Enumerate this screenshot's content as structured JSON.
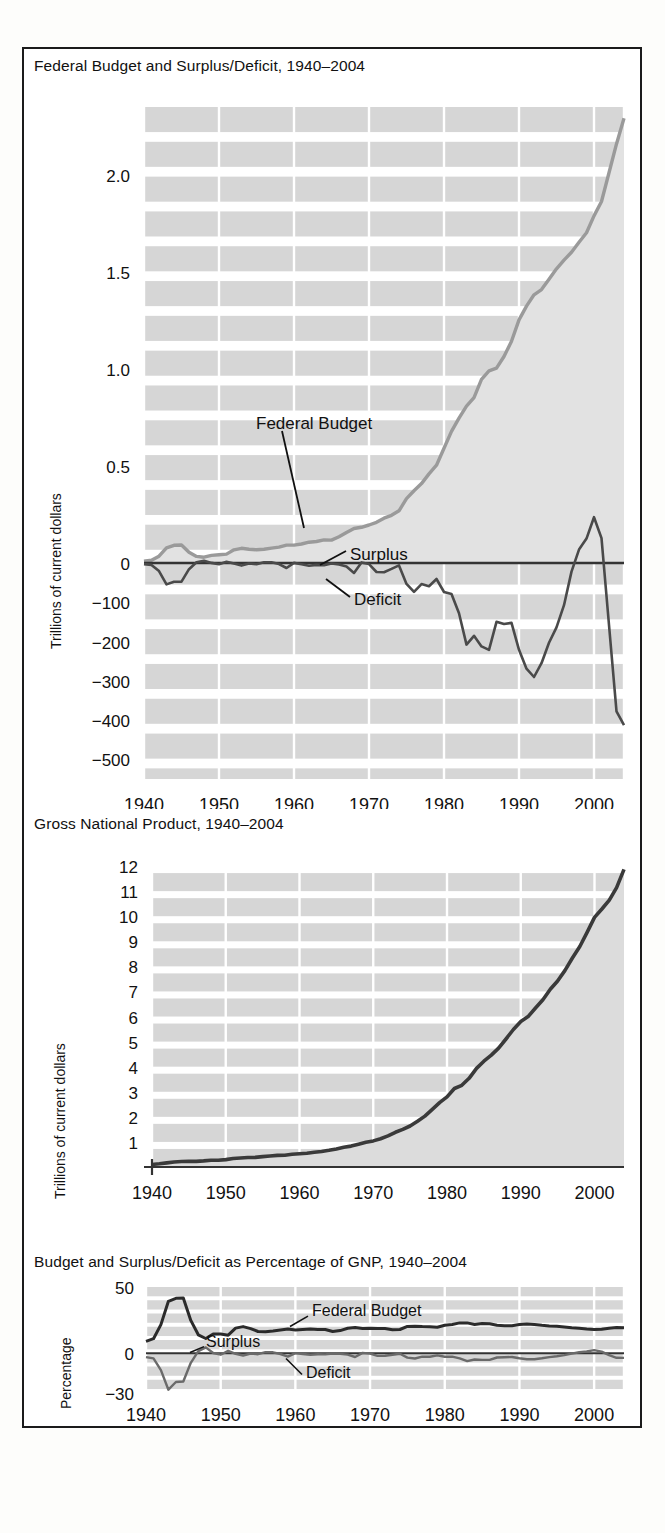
{
  "figure": {
    "background": "#ffffff",
    "border_color": "#1b1b1b",
    "grid_band_color": "#cfcfcf",
    "grid_line_color": "#ffffff",
    "axis_color": "#333333",
    "budget_line_color": "#9a9a9a",
    "budget_fill_color": "#e2e2e2",
    "deficit_line_color": "#4a4a4a",
    "gnp_line_color": "#3a3a3a",
    "gnp_fill_color": "#dcdcdc"
  },
  "chart_data": [
    {
      "id": "federal-budget-surplus-deficit",
      "type": "line",
      "title": "Federal Budget and Surplus/Deficit, 1940–2004",
      "xlabel": "",
      "ylabel": "Trillions of current dollars",
      "grid": true,
      "legend_position": "inline-annotation",
      "annotations": [
        {
          "label": "Federal Budget",
          "x": 1960,
          "y": 0.63
        },
        {
          "label": "Surplus",
          "x": 1967,
          "y": 0.1
        },
        {
          "label": "Deficit",
          "x": 1967,
          "y": -0.1
        }
      ],
      "xlim": [
        1940,
        2004
      ],
      "xticks": [
        1940,
        1950,
        1960,
        1970,
        1980,
        1990,
        2000
      ],
      "yticks_upper": [
        0,
        0.5,
        1.0,
        1.5,
        2.0
      ],
      "yticklabels_upper": [
        "0",
        "0.5",
        "1.0",
        "1.5",
        "2.0"
      ],
      "yticks_lower": [
        -100,
        -200,
        -300,
        -400,
        -500
      ],
      "yticklabels_lower": [
        "−100",
        "−200",
        "−300",
        "−400",
        "−500"
      ],
      "ylim_upper": [
        0,
        2.35
      ],
      "ylim_lower": [
        -550,
        0
      ],
      "note_upper_units": "Trillions of current dollars",
      "note_lower_units": "Billions of current dollars",
      "series": [
        {
          "name": "Federal Budget",
          "x": [
            1940,
            1941,
            1942,
            1943,
            1944,
            1945,
            1946,
            1947,
            1948,
            1949,
            1950,
            1951,
            1952,
            1953,
            1954,
            1955,
            1956,
            1957,
            1958,
            1959,
            1960,
            1961,
            1962,
            1963,
            1964,
            1965,
            1966,
            1967,
            1968,
            1969,
            1970,
            1971,
            1972,
            1973,
            1974,
            1975,
            1976,
            1977,
            1978,
            1979,
            1980,
            1981,
            1982,
            1983,
            1984,
            1985,
            1986,
            1987,
            1988,
            1989,
            1990,
            1991,
            1992,
            1993,
            1994,
            1995,
            1996,
            1997,
            1998,
            1999,
            2000,
            2001,
            2002,
            2003,
            2004
          ],
          "values": [
            0.009,
            0.014,
            0.035,
            0.078,
            0.091,
            0.093,
            0.055,
            0.034,
            0.03,
            0.039,
            0.043,
            0.046,
            0.068,
            0.076,
            0.071,
            0.068,
            0.071,
            0.077,
            0.082,
            0.092,
            0.092,
            0.098,
            0.107,
            0.111,
            0.119,
            0.118,
            0.135,
            0.157,
            0.178,
            0.184,
            0.196,
            0.21,
            0.231,
            0.246,
            0.269,
            0.332,
            0.372,
            0.409,
            0.459,
            0.504,
            0.591,
            0.678,
            0.746,
            0.808,
            0.852,
            0.946,
            0.99,
            1.004,
            1.064,
            1.143,
            1.253,
            1.324,
            1.382,
            1.409,
            1.462,
            1.516,
            1.561,
            1.601,
            1.653,
            1.702,
            1.789,
            1.863,
            2.011,
            2.16,
            2.292
          ]
        },
        {
          "name": "Surplus/Deficit",
          "x": [
            1940,
            1941,
            1942,
            1943,
            1944,
            1945,
            1946,
            1947,
            1948,
            1949,
            1950,
            1951,
            1952,
            1953,
            1954,
            1955,
            1956,
            1957,
            1958,
            1959,
            1960,
            1961,
            1962,
            1963,
            1964,
            1965,
            1966,
            1967,
            1968,
            1969,
            1970,
            1971,
            1972,
            1973,
            1974,
            1975,
            1976,
            1977,
            1978,
            1979,
            1980,
            1981,
            1982,
            1983,
            1984,
            1985,
            1986,
            1987,
            1988,
            1989,
            1990,
            1991,
            1992,
            1993,
            1994,
            1995,
            1996,
            1997,
            1998,
            1999,
            2000,
            2001,
            2002,
            2003,
            2004
          ],
          "values": [
            -2.9,
            -4.9,
            -20.5,
            -54.6,
            -47.6,
            -47.6,
            -15.9,
            4.0,
            11.8,
            0.6,
            -3.1,
            6.1,
            -1.5,
            -6.5,
            -1.2,
            -3.0,
            3.9,
            3.4,
            -2.8,
            -12.8,
            0.3,
            -3.3,
            -7.1,
            -4.8,
            -5.9,
            -1.4,
            -3.7,
            -8.6,
            -25.2,
            3.2,
            -2.8,
            -23.0,
            -23.4,
            -14.9,
            -6.1,
            -53.2,
            -73.7,
            -53.7,
            -59.2,
            -40.7,
            -73.8,
            -79.0,
            -128.0,
            -207.8,
            -185.4,
            -212.3,
            -221.2,
            -149.7,
            -155.2,
            -152.6,
            -221.0,
            -269.2,
            -290.3,
            -255.1,
            -203.2,
            -164.0,
            -107.4,
            -21.9,
            69.3,
            125.6,
            236.2,
            128.2,
            -157.8,
            -377.6,
            -412.7
          ]
        }
      ]
    },
    {
      "id": "gross-national-product",
      "type": "area",
      "title": "Gross National Product, 1940–2004",
      "xlabel": "",
      "ylabel": "Trillions of current dollars",
      "grid": true,
      "legend_position": "none",
      "xlim": [
        1940,
        2004
      ],
      "xticks": [
        1940,
        1950,
        1960,
        1970,
        1980,
        1990,
        2000
      ],
      "yticks": [
        1,
        2,
        3,
        4,
        5,
        6,
        7,
        8,
        9,
        10,
        11,
        12
      ],
      "yticklabels": [
        "1",
        "2",
        "3",
        "4",
        "5",
        "6",
        "7",
        "8",
        "9",
        "10",
        "11",
        "12"
      ],
      "ylim": [
        0,
        12.6
      ],
      "series": [
        {
          "name": "GNP",
          "x": [
            1940,
            1941,
            1942,
            1943,
            1944,
            1945,
            1946,
            1947,
            1948,
            1949,
            1950,
            1951,
            1952,
            1953,
            1954,
            1955,
            1956,
            1957,
            1958,
            1959,
            1960,
            1961,
            1962,
            1963,
            1964,
            1965,
            1966,
            1967,
            1968,
            1969,
            1970,
            1971,
            1972,
            1973,
            1974,
            1975,
            1976,
            1977,
            1978,
            1979,
            1980,
            1981,
            1982,
            1983,
            1984,
            1985,
            1986,
            1987,
            1988,
            1989,
            1990,
            1991,
            1992,
            1993,
            1994,
            1995,
            1996,
            1997,
            1998,
            1999,
            2000,
            2001,
            2002,
            2003,
            2004
          ],
          "values": [
            0.101,
            0.127,
            0.162,
            0.199,
            0.219,
            0.223,
            0.222,
            0.244,
            0.27,
            0.268,
            0.294,
            0.339,
            0.358,
            0.379,
            0.381,
            0.415,
            0.438,
            0.461,
            0.468,
            0.505,
            0.527,
            0.545,
            0.586,
            0.618,
            0.664,
            0.72,
            0.789,
            0.834,
            0.911,
            0.985,
            1.039,
            1.128,
            1.24,
            1.385,
            1.501,
            1.635,
            1.824,
            2.031,
            2.295,
            2.566,
            2.795,
            3.131,
            3.259,
            3.535,
            3.933,
            4.22,
            4.463,
            4.739,
            5.104,
            5.484,
            5.803,
            5.996,
            6.338,
            6.667,
            7.085,
            7.415,
            7.839,
            8.332,
            8.794,
            9.354,
            9.952,
            10.286,
            10.642,
            11.142,
            11.868
          ]
        }
      ]
    },
    {
      "id": "budget-deficit-pct-gnp",
      "type": "line",
      "title": "Budget and Surplus/Deficit as Percentage of GNP, 1940–2004",
      "xlabel": "",
      "ylabel": "Percentage",
      "grid": true,
      "legend_position": "inline-annotation",
      "annotations": [
        {
          "label": "Federal Budget",
          "x": 1977,
          "y": 28
        },
        {
          "label": "Surplus",
          "x": 1955,
          "y": 7
        },
        {
          "label": "Deficit",
          "x": 1968,
          "y": -14
        }
      ],
      "xlim": [
        1940,
        2004
      ],
      "xticks": [
        1940,
        1950,
        1960,
        1970,
        1980,
        1990,
        2000
      ],
      "yticks": [
        -30,
        0,
        50
      ],
      "yticklabels": [
        "−30",
        "0",
        "50"
      ],
      "ylim": [
        -30,
        50
      ],
      "series": [
        {
          "name": "Federal Budget",
          "x": [
            1940,
            1941,
            1942,
            1943,
            1944,
            1945,
            1946,
            1947,
            1948,
            1949,
            1950,
            1951,
            1952,
            1953,
            1954,
            1955,
            1956,
            1957,
            1958,
            1959,
            1960,
            1961,
            1962,
            1963,
            1964,
            1965,
            1966,
            1967,
            1968,
            1969,
            1970,
            1971,
            1972,
            1973,
            1974,
            1975,
            1976,
            1977,
            1978,
            1979,
            1980,
            1981,
            1982,
            1983,
            1984,
            1985,
            1986,
            1987,
            1988,
            1989,
            1990,
            1991,
            1992,
            1993,
            1994,
            1995,
            1996,
            1997,
            1998,
            1999,
            2000,
            2001,
            2002,
            2003,
            2004
          ],
          "values": [
            9.0,
            11.0,
            21.6,
            39.2,
            41.5,
            41.7,
            24.8,
            13.9,
            11.1,
            14.6,
            14.6,
            13.6,
            19.0,
            20.1,
            18.6,
            16.4,
            16.2,
            16.7,
            17.5,
            18.2,
            17.5,
            18.0,
            18.3,
            18.0,
            17.9,
            16.4,
            17.1,
            18.8,
            19.5,
            18.7,
            18.9,
            18.6,
            18.6,
            17.8,
            17.9,
            20.3,
            20.4,
            20.1,
            20.0,
            19.6,
            21.1,
            21.7,
            22.9,
            22.9,
            21.7,
            22.4,
            22.2,
            21.2,
            20.8,
            20.8,
            21.6,
            22.1,
            21.8,
            21.1,
            20.6,
            20.4,
            19.9,
            19.2,
            18.8,
            18.2,
            18.0,
            18.1,
            18.9,
            19.4,
            19.3
          ]
        },
        {
          "name": "Surplus/Deficit",
          "x": [
            1940,
            1941,
            1942,
            1943,
            1944,
            1945,
            1946,
            1947,
            1948,
            1949,
            1950,
            1951,
            1952,
            1953,
            1954,
            1955,
            1956,
            1957,
            1958,
            1959,
            1960,
            1961,
            1962,
            1963,
            1964,
            1965,
            1966,
            1967,
            1968,
            1969,
            1970,
            1971,
            1972,
            1973,
            1974,
            1975,
            1976,
            1977,
            1978,
            1979,
            1980,
            1981,
            1982,
            1983,
            1984,
            1985,
            1986,
            1987,
            1988,
            1989,
            1990,
            1991,
            1992,
            1993,
            1994,
            1995,
            1996,
            1997,
            1998,
            1999,
            2000,
            2001,
            2002,
            2003,
            2004
          ],
          "values": [
            -2.9,
            -3.9,
            -12.7,
            -27.5,
            -21.7,
            -21.3,
            -7.2,
            1.6,
            4.4,
            0.2,
            -1.1,
            1.8,
            -0.4,
            -1.7,
            -0.3,
            -0.7,
            0.9,
            0.7,
            -0.6,
            -2.5,
            0.1,
            -0.6,
            -1.2,
            -0.8,
            -0.9,
            -0.2,
            -0.5,
            -1.0,
            -2.8,
            0.3,
            -0.3,
            -2.0,
            -1.9,
            -1.1,
            -0.4,
            -3.3,
            -4.0,
            -2.6,
            -2.6,
            -1.6,
            -2.6,
            -2.5,
            -3.9,
            -5.9,
            -4.7,
            -5.0,
            -5.0,
            -3.2,
            -3.0,
            -2.8,
            -3.8,
            -4.5,
            -4.6,
            -3.8,
            -2.9,
            -2.2,
            -1.4,
            -0.3,
            0.8,
            1.3,
            2.4,
            1.2,
            -1.5,
            -3.4,
            -3.5
          ]
        }
      ]
    }
  ]
}
